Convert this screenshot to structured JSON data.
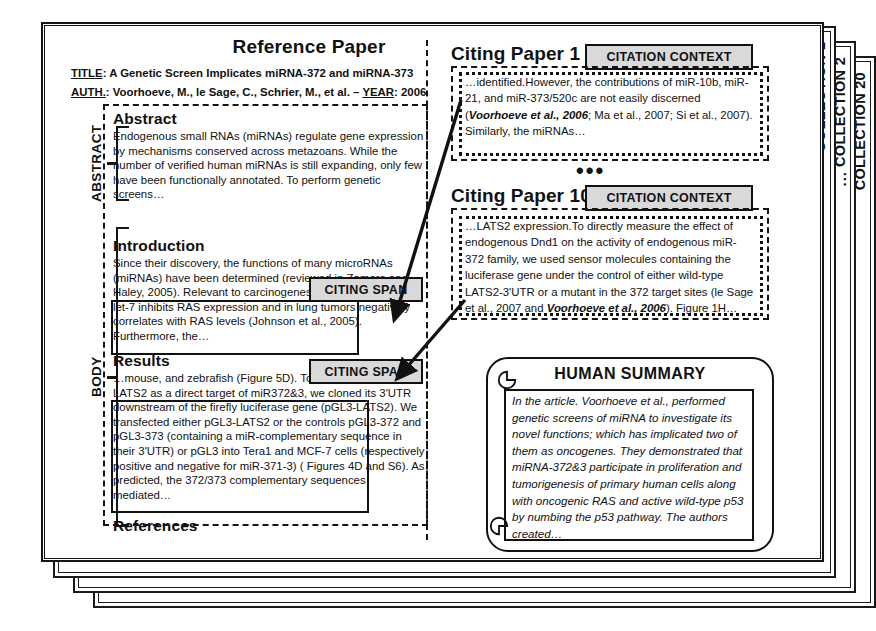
{
  "collections": [
    {
      "label": "COLLECTION 1"
    },
    {
      "label": "COLLECTION 2"
    },
    {
      "label": "COLLECTION 20"
    }
  ],
  "collections_ellipsis": "...",
  "reference_paper": {
    "heading": "Reference Paper",
    "title_label": "TITLE",
    "title_value": ": A Genetic Screen Implicates miRNA-372 and miRNA-373",
    "auth_label": "AUTH.",
    "auth_value": ": Voorhoeve, M., le Sage, C., Schrier, M., et al. – ",
    "year_label": "YEAR",
    "year_value": ": 2006",
    "side_labels": {
      "abstract": "ABSTRACT",
      "body": "BODY"
    },
    "sections": [
      {
        "id": "abstract",
        "heading": "Abstract",
        "text": "Endogenous small RNAs (miRNAs) regulate gene expression by mechanisms conserved across metazoans. While the number of verified human miRNAs is still expanding, only few have been functionally annotated. To perform genetic screens…"
      },
      {
        "id": "introduction",
        "heading": "Introduction",
        "text": "Since their discovery, the functions of many microRNAs (miRNAs) have been determined (reviewed in Zamore and Haley, 2005). Relevant to carcinogenesis, it was found that let-7 inhibits RAS expression and in lung tumors negatively correlates with RAS levels (Johnson et al., 2005). Furthermore, the…"
      },
      {
        "id": "results",
        "heading": "Results",
        "text": "…mouse, and zebrafish (Figure 5D). To further substantiate LATS2 as a direct target of miR372&3, we cloned its 3'UTR downstream of the firefly luciferase gene (pGL3-LATS2). We transfected either pGL3-LATS2 or the controls pGL3-372 and pGL3-373 (containing a miR-complementary sequence in their 3'UTR) or pGL3 into Tera1 and MCF-7 cells (respectively positive and negative for miR-371-3) ( Figures 4D and S6). As predicted, the 372/373 complementary sequences mediated…"
      },
      {
        "id": "references",
        "heading": "References",
        "text": ""
      }
    ],
    "citing_span_tag": "CITING SPAN"
  },
  "citing_papers": [
    {
      "title": "Citing Paper 1",
      "tag": "CITATION CONTEXT",
      "text_lead": "…identified.",
      "text_body": "However, the contributions of miR-10b, miR-21, and miR-373/520c are not easily discerned (",
      "text_bold": "Voorhoeve et al., 2006",
      "text_tail": "; Ma et al., 2007; Si et al., 2007).",
      "text_after": " Similarly, the miRNAs…"
    },
    {
      "title": "Citing Paper 10",
      "tag": "CITATION CONTEXT",
      "text_lead": "…LATS2 expression.",
      "text_body": "To directly measure the effect of endogenous Dnd1 on the activity of endogenous miR-372 family, we used sensor molecules containing the luciferase gene under the control of either wild-type LATS2-3'UTR or a mutant in the 372 target sites (le Sage et al., 2007 and ",
      "text_bold": "Voorhoeve et al., 2006",
      "text_tail": ").",
      "text_after": " Figure 1H…"
    }
  ],
  "papers_ellipsis": "•••",
  "human_summary": {
    "title": "HUMAN SUMMARY",
    "text": "In the article. Voorhoeve et al., performed genetic screens of miRNA to investigate its novel functions; which has implicated two of them as oncogenes.  They demonstrated that miRNA-372&3 participate in proliferation and tumorigenesis of primary human cells along with oncogenic RAS and active wild-type p53 by numbing the p53 pathway. The authors created…"
  },
  "colors": {
    "ink": "#111111",
    "tag_fill": "#d9d9d9",
    "page": "#ffffff"
  }
}
